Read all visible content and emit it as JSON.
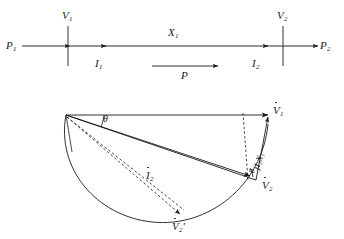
{
  "figure": {
    "width": 344,
    "height": 239,
    "background": "#ffffff",
    "ink": "#1a1a1a"
  },
  "circuit": {
    "labels": {
      "p1": "P",
      "p1_sub": "1",
      "p2": "P",
      "p2_sub": "2",
      "v1": "V",
      "v1_sub": "1",
      "v2": "V",
      "v2_sub": "2",
      "i1": "I",
      "i1_sub": "1",
      "i2": "I",
      "i2_sub": "2",
      "x1": "X",
      "x1_sub": "1",
      "p_flow": "P"
    }
  },
  "phasor": {
    "labels": {
      "v1": "V",
      "v1_sub": "1",
      "v2": "V",
      "v2_sub": "2",
      "v2_prime": "V",
      "v2_prime_sub": "2",
      "v2_prime_mark": "′",
      "i2": "I",
      "i2_sub": "2",
      "reactance_drop": "jI",
      "reactance_drop_sub": "2",
      "reactance_drop_tail": "X",
      "reactance_drop_tail_sub": "1",
      "theta_upper": "θ",
      "theta_lower": "θ"
    }
  }
}
